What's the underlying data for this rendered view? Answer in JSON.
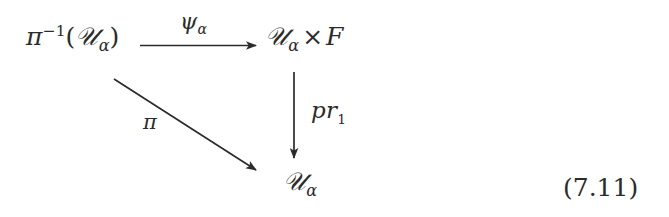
{
  "figure": {
    "kind": "commutative-diagram",
    "equation_number": "(7.11)",
    "nodes": [
      {
        "id": "source",
        "latex": "\\pi^{-1}(\\mathcal{U}_\\alpha)",
        "plain": "pi^-1(U_alpha)",
        "base": "π",
        "superscript": "−1",
        "open_paren": "(",
        "script_letter": "𝒰",
        "subscript": "α",
        "close_paren": ")"
      },
      {
        "id": "target",
        "latex": "\\mathcal{U}_\\alpha \\times F",
        "plain": "U_alpha x F",
        "script_letter": "𝒰",
        "subscript": "α",
        "operator": "×",
        "fiber": "F"
      },
      {
        "id": "base",
        "latex": "\\mathcal{U}_\\alpha",
        "plain": "U_alpha",
        "script_letter": "𝒰",
        "subscript": "α"
      }
    ],
    "arrows": [
      {
        "id": "psi",
        "from": "source",
        "to": "target",
        "direction": "horizontal-right",
        "label": "ψ",
        "label_subscript": "α",
        "label_plain": "psi_alpha"
      },
      {
        "id": "pi",
        "from": "source",
        "to": "base",
        "direction": "diagonal-down-right",
        "label": "π",
        "label_subscript": "",
        "label_plain": "pi"
      },
      {
        "id": "pr1",
        "from": "target",
        "to": "base",
        "direction": "vertical-down",
        "label": "pr",
        "label_subscript": "1",
        "label_plain": "pr_1"
      }
    ],
    "colors": {
      "ink": "#2b2b2b",
      "background": "#ffffff"
    }
  }
}
